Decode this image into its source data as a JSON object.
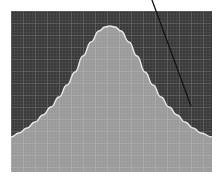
{
  "figure": {
    "width": 223,
    "height": 184,
    "background_color": "#ffffff",
    "margin_left": 11,
    "margin_top": 11,
    "margin_right": 11,
    "margin_bottom": 12
  },
  "chart_data": {
    "type": "area",
    "title": "",
    "subtitle": "",
    "xlabel": "",
    "ylabel": "",
    "xlim": [
      0,
      201
    ],
    "ylim": [
      0,
      161
    ],
    "grid": true,
    "grid_minor_spacing": 3,
    "grid_major_spacing": 12,
    "legend": null,
    "tick_labels_x": [],
    "tick_labels_y": [],
    "colors": {
      "plot_background": "#3a3a3a",
      "grid_minor": "#4f4f4f",
      "grid_major": "#6a6a6a",
      "fill": "#9a9a9a",
      "fill_grid_minor": "#a6a6a6",
      "fill_grid_major": "#b4b4b4",
      "curve_outline": "#e8e8e8",
      "annotation_line": "#141414"
    },
    "series": [
      {
        "name": "distribution",
        "kind": "gaussian-area",
        "peak_x": 99,
        "peak_y": 15,
        "baseline_y": 161,
        "x": [
          0,
          8,
          16,
          24,
          32,
          40,
          48,
          56,
          64,
          72,
          80,
          88,
          94,
          99,
          104,
          110,
          118,
          126,
          134,
          142,
          150,
          158,
          166,
          174,
          182,
          190,
          201
        ],
        "y": [
          126,
          122,
          117,
          111,
          104,
          96,
          86,
          74,
          61,
          45,
          31,
          20,
          16,
          15,
          16,
          20,
          31,
          45,
          61,
          74,
          86,
          96,
          104,
          111,
          117,
          122,
          126
        ]
      }
    ],
    "annotations": [
      {
        "name": "leader-line",
        "kind": "line",
        "x1": 152,
        "y1": 0,
        "x2": 191,
        "y2": 106,
        "color": "#141414",
        "width": 1.3
      }
    ]
  }
}
